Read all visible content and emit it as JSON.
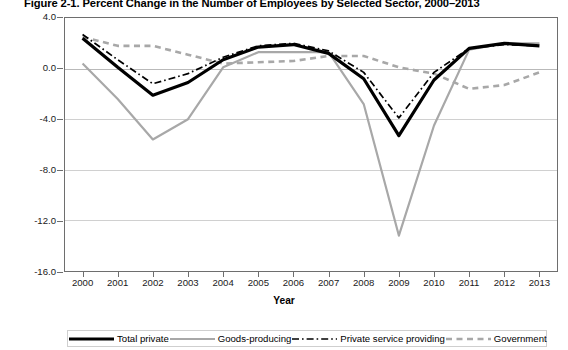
{
  "chart_data": {
    "type": "line",
    "title": "Figure 2-1. Percent Change in the Number of Employees by Selected Sector, 2000–2013",
    "xlabel": "Year",
    "ylabel": "Percent",
    "categories": [
      "2000",
      "2001",
      "2002",
      "2003",
      "2004",
      "2005",
      "2006",
      "2007",
      "2008",
      "2009",
      "2010",
      "2011",
      "2012",
      "2013"
    ],
    "x": [
      2000,
      2001,
      2002,
      2003,
      2004,
      2005,
      2006,
      2007,
      2008,
      2009,
      2010,
      2011,
      2012,
      2013
    ],
    "ylim": [
      -16.0,
      4.0
    ],
    "yticks": [
      4.0,
      0.0,
      -4.0,
      -8.0,
      -12.0,
      -16.0
    ],
    "ytick_labels": [
      "4.0",
      "0.0",
      "-4.0",
      "-8.0",
      "-12.0",
      "-16.0"
    ],
    "grid": true,
    "legend_position": "bottom",
    "series": [
      {
        "name": "Total private",
        "style": "solid-thick-black",
        "color": "#000000",
        "values": [
          2.4,
          0.1,
          -2.1,
          -1.1,
          0.7,
          1.7,
          1.9,
          1.2,
          -0.8,
          -5.3,
          -0.9,
          1.6,
          2.0,
          1.8
        ]
      },
      {
        "name": "Goods-producing",
        "style": "solid-gray",
        "color": "#a8a8a8",
        "values": [
          0.4,
          -2.4,
          -5.6,
          -4.0,
          0.1,
          1.3,
          1.3,
          1.3,
          -2.8,
          -13.2,
          -4.5,
          1.5,
          2.0,
          2.0
        ]
      },
      {
        "name": "Private service providing",
        "style": "dash-dot-black",
        "color": "#000000",
        "values": [
          2.7,
          0.7,
          -1.2,
          -0.4,
          0.9,
          1.8,
          2.0,
          1.4,
          -0.3,
          -3.9,
          -0.3,
          1.6,
          1.9,
          1.8
        ]
      },
      {
        "name": "Government",
        "style": "dashed-gray",
        "color": "#a8a8a8",
        "values": [
          2.5,
          1.8,
          1.8,
          1.1,
          0.4,
          0.5,
          0.6,
          1.0,
          1.0,
          0.1,
          -0.4,
          -1.6,
          -1.3,
          -0.3
        ]
      }
    ]
  },
  "legend": {
    "items": [
      {
        "label": "Total private",
        "key": "total-private"
      },
      {
        "label": "Goods-producing",
        "key": "goods-producing"
      },
      {
        "label": "Private service providing",
        "key": "private-service-providing"
      },
      {
        "label": "Government",
        "key": "government"
      }
    ]
  }
}
